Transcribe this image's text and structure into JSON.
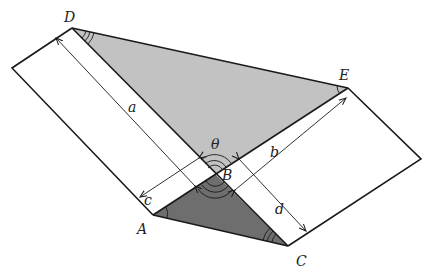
{
  "diagram": {
    "points": {
      "D": {
        "label": "D",
        "x": 72,
        "y": 28
      },
      "E": {
        "label": "E",
        "x": 348,
        "y": 88
      },
      "B": {
        "label": "B",
        "x": 215,
        "y": 174
      },
      "A": {
        "label": "A",
        "x": 153,
        "y": 215
      },
      "C": {
        "label": "C",
        "x": 288,
        "y": 246
      }
    },
    "lengths": {
      "a": "a",
      "b": "b",
      "c": "c",
      "d": "d"
    },
    "angle_label": "θ",
    "colors": {
      "upper_triangle": "#c2c2c2",
      "lower_triangle": "#6e6e6e",
      "stroke": "#1a1a1a"
    }
  }
}
